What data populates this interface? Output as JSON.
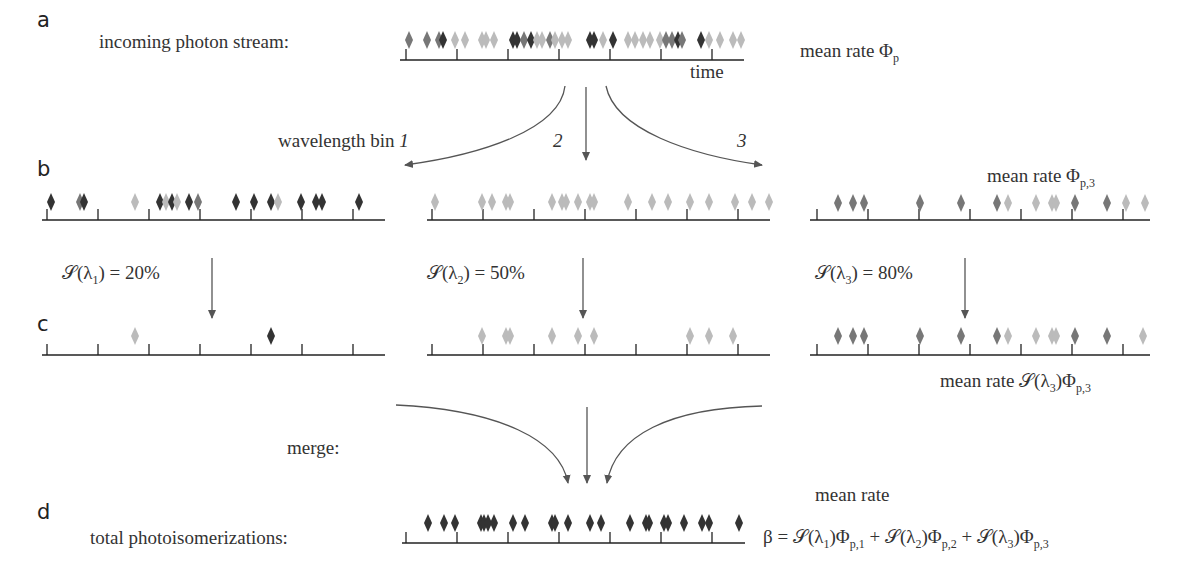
{
  "panels": {
    "a": {
      "letter": "a",
      "label": "incoming photon stream:",
      "axis_label": "time",
      "rate_prefix": "mean rate Φ",
      "rate_sub": "p"
    },
    "split": {
      "bin_label": "wavelength bin ",
      "bins": [
        "1",
        "2",
        "3"
      ]
    },
    "b": {
      "letter": "b",
      "rate_prefix": "mean rate Φ",
      "rate_sub": "p,3"
    },
    "sensitivity": [
      {
        "text": "𝒮(λ",
        "sub": "1",
        "tail": ") = 20%"
      },
      {
        "text": "𝒮(λ",
        "sub": "2",
        "tail": ") = 50%"
      },
      {
        "text": "𝒮(λ",
        "sub": "3",
        "tail": ") = 80%"
      }
    ],
    "c": {
      "letter": "c",
      "rate_prefix": "mean rate 𝒮(λ",
      "rate_sub1": "3",
      "rate_mid": ")Φ",
      "rate_sub2": "p,3"
    },
    "merge": {
      "label": "merge:"
    },
    "d": {
      "letter": "d",
      "label": "total photoisomerizations:",
      "rate_label": "mean rate",
      "formula": {
        "beta": "β = ",
        "terms": [
          {
            "s": "𝒮(λ",
            "i": "1",
            "phi": ")Φ",
            "sub": "p,1",
            "plus": " + "
          },
          {
            "s": "𝒮(λ",
            "i": "2",
            "phi": ")Φ",
            "sub": "p,2",
            "plus": " + "
          },
          {
            "s": "𝒮(λ",
            "i": "3",
            "phi": ")Φ",
            "sub": "p,3",
            "plus": ""
          }
        ]
      }
    }
  },
  "colors": {
    "dark": "#333333",
    "mid": "#777777",
    "light": "#bbbbbb",
    "axis": "#222222",
    "arrow": "#555555"
  }
}
